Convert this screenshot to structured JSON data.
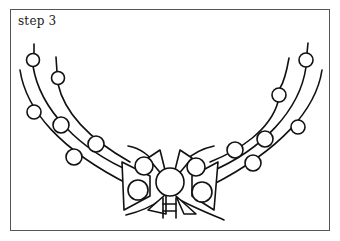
{
  "page": {
    "step_label": "step 3"
  },
  "illustration": {
    "subject": "garland-with-beads-and-bow",
    "stroke_color": "#111111",
    "frame_color": "#555555",
    "background": "#ffffff"
  }
}
